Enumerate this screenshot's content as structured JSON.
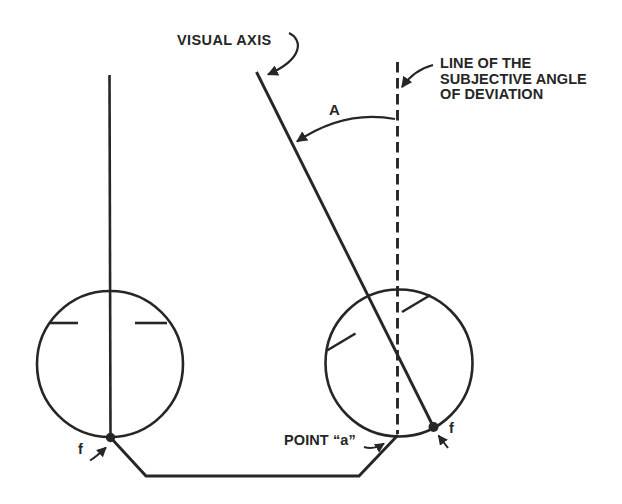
{
  "figure": {
    "background": "#ffffff",
    "ink": "#262626"
  },
  "labels": {
    "visual_axis": "VISUAL AXIS",
    "subjective_angle_line": "LINE OF THE\nSUBJECTIVE ANGLE\nOF DEVIATION",
    "angle": "A",
    "point_a": "POINT “a”",
    "left_fovea": "f",
    "right_fovea": "f"
  }
}
